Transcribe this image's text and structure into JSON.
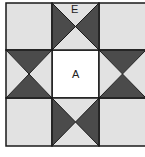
{
  "diagram": {
    "type": "quilt-block",
    "pattern": "ohio-star-3x3",
    "labels": {
      "top_center": "E",
      "center": "A"
    },
    "colors": {
      "light": "#e2e2e2",
      "dark": "#4b4b4b",
      "center": "#ffffff",
      "line": "#1a1a1a"
    },
    "grid": {
      "rows": 3,
      "cols": 3
    }
  }
}
